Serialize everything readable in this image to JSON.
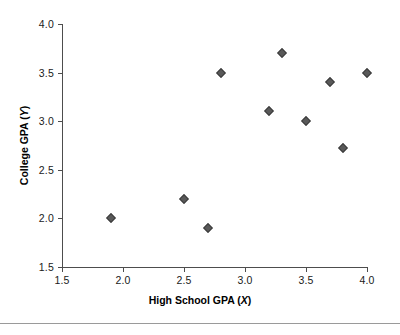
{
  "chart_data": {
    "type": "scatter",
    "title": "",
    "xlabel": "High School GPA (X)",
    "xlabel_text": "High School GPA (",
    "xlabel_var": "X",
    "xlabel_close": ")",
    "ylabel": "College GPA (Y)",
    "ylabel_text": "College GPA (",
    "ylabel_var": "Y",
    "ylabel_close": ")",
    "xlim": [
      1.5,
      4.0
    ],
    "ylim": [
      1.5,
      4.0
    ],
    "xticks": [
      1.5,
      2.0,
      2.5,
      3.0,
      3.5,
      4.0
    ],
    "yticks": [
      1.5,
      2.0,
      2.5,
      3.0,
      3.5,
      4.0
    ],
    "xtick_labels": [
      "1.5",
      "2.0",
      "2.5",
      "3.0",
      "3.5",
      "4.0"
    ],
    "ytick_labels": [
      "1.5",
      "2.0",
      "2.5",
      "3.0",
      "3.5",
      "4.0"
    ],
    "grid": false,
    "legend": false,
    "marker": "diamond",
    "marker_color": "#595959",
    "axis_color": "#4d4d4d",
    "points": [
      {
        "x": 1.9,
        "y": 2.0
      },
      {
        "x": 2.5,
        "y": 2.2
      },
      {
        "x": 2.7,
        "y": 1.9
      },
      {
        "x": 2.8,
        "y": 3.5
      },
      {
        "x": 3.2,
        "y": 3.1
      },
      {
        "x": 3.3,
        "y": 3.7
      },
      {
        "x": 3.5,
        "y": 3.0
      },
      {
        "x": 3.7,
        "y": 3.4
      },
      {
        "x": 3.8,
        "y": 2.72
      },
      {
        "x": 4.0,
        "y": 3.5
      }
    ]
  }
}
